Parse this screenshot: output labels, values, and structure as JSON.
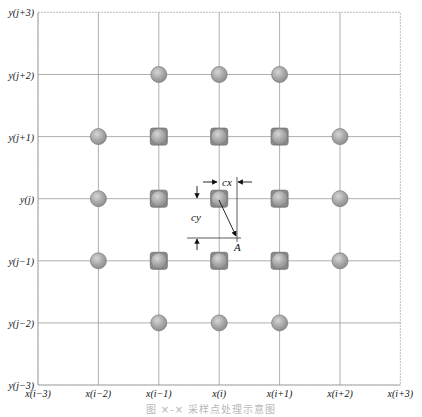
{
  "diagram": {
    "x_labels": [
      "x(i−3)",
      "x(i−2)",
      "x(i−1)",
      "x(i)",
      "x(i+1)",
      "x(i+2)",
      "x(i+3)"
    ],
    "y_labels": [
      "y(j−3)",
      "y(j−2)",
      "y(j−1)",
      "y(j)",
      "y(j+1)",
      "y(j+2)",
      "y(j+3)"
    ],
    "markers": [
      {
        "col": 2,
        "row": 5,
        "type": "circle"
      },
      {
        "col": 3,
        "row": 5,
        "type": "circle"
      },
      {
        "col": 4,
        "row": 5,
        "type": "circle"
      },
      {
        "col": 1,
        "row": 4,
        "type": "circle"
      },
      {
        "col": 2,
        "row": 4,
        "type": "square"
      },
      {
        "col": 3,
        "row": 4,
        "type": "square"
      },
      {
        "col": 4,
        "row": 4,
        "type": "square"
      },
      {
        "col": 5,
        "row": 4,
        "type": "circle"
      },
      {
        "col": 1,
        "row": 3,
        "type": "circle"
      },
      {
        "col": 2,
        "row": 3,
        "type": "square"
      },
      {
        "col": 3,
        "row": 3,
        "type": "square"
      },
      {
        "col": 4,
        "row": 3,
        "type": "square"
      },
      {
        "col": 5,
        "row": 3,
        "type": "circle"
      },
      {
        "col": 1,
        "row": 2,
        "type": "circle"
      },
      {
        "col": 2,
        "row": 2,
        "type": "square"
      },
      {
        "col": 3,
        "row": 2,
        "type": "square"
      },
      {
        "col": 4,
        "row": 2,
        "type": "square"
      },
      {
        "col": 5,
        "row": 2,
        "type": "circle"
      },
      {
        "col": 2,
        "row": 1,
        "type": "circle"
      },
      {
        "col": 3,
        "row": 1,
        "type": "circle"
      },
      {
        "col": 4,
        "row": 1,
        "type": "circle"
      }
    ],
    "annotations": {
      "cx_label": "cx",
      "cy_label": "cy",
      "point_label": "A"
    },
    "colors": {
      "grid": "#9a9a9a",
      "border": "#c8c8c8",
      "marker_fill": "#a9a9a9",
      "marker_stroke": "#7a7a7a",
      "square_fill": "#8c8c8c",
      "arrow": "#111111"
    }
  },
  "caption": "图 ×-× 采样点处理示意图"
}
